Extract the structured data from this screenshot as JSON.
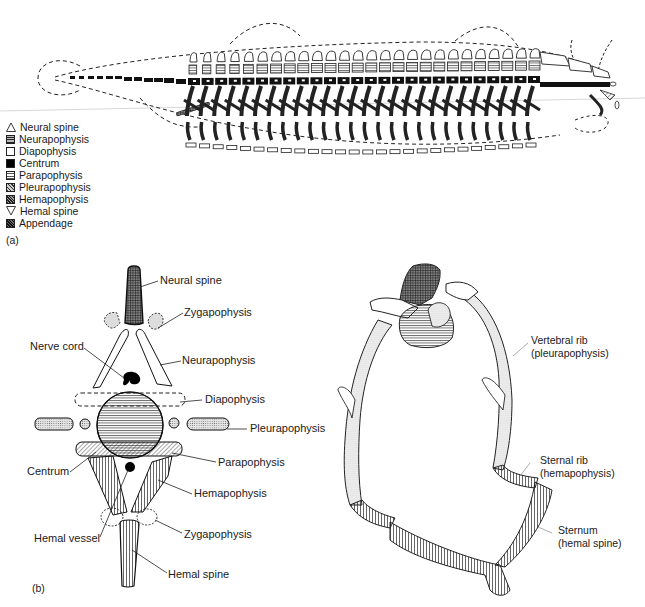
{
  "panel_a": {
    "tag": "(a)",
    "legend": [
      {
        "symbol": "triangle-up-outline",
        "label": "Neural spine"
      },
      {
        "symbol": "horizontal-lines-dark",
        "label": "Neurapophysis"
      },
      {
        "symbol": "empty-square",
        "label": "Diapophysis"
      },
      {
        "symbol": "solid-black-square",
        "label": "Centrum"
      },
      {
        "symbol": "horizontal-lines-light",
        "label": "Parapophysis"
      },
      {
        "symbol": "diagonal-hatch-light",
        "label": "Pleurapophysis"
      },
      {
        "symbol": "diagonal-hatch-dark",
        "label": "Hemapophysis"
      },
      {
        "symbol": "triangle-down-outline",
        "label": "Hemal spine"
      },
      {
        "symbol": "cross-hatch-dark",
        "label": "Appendage"
      }
    ]
  },
  "panel_b": {
    "tag": "(b)",
    "vertebra_labels": {
      "neural_spine": "Neural spine",
      "zygapophysis_top": "Zygapophysis",
      "nerve_cord": "Nerve cord",
      "neurapophysis": "Neurapophysis",
      "diapophysis": "Diapophysis",
      "pleurapophysis": "Pleurapophysis",
      "parapophysis": "Parapophysis",
      "centrum": "Centrum",
      "hemapophysis": "Hemapophysis",
      "hemal_vessel": "Hemal vessel",
      "zygapophysis_bottom": "Zygapophysis",
      "hemal_spine": "Hemal spine"
    },
    "ribcage_labels": {
      "vertebral_rib_1": "Vertebral rib",
      "vertebral_rib_2": "(pleurapophysis)",
      "sternal_rib_1": "Sternal rib",
      "sternal_rib_2": "(hemapophysis)",
      "sternum_1": "Sternum",
      "sternum_2": "(hemal spine)"
    }
  }
}
